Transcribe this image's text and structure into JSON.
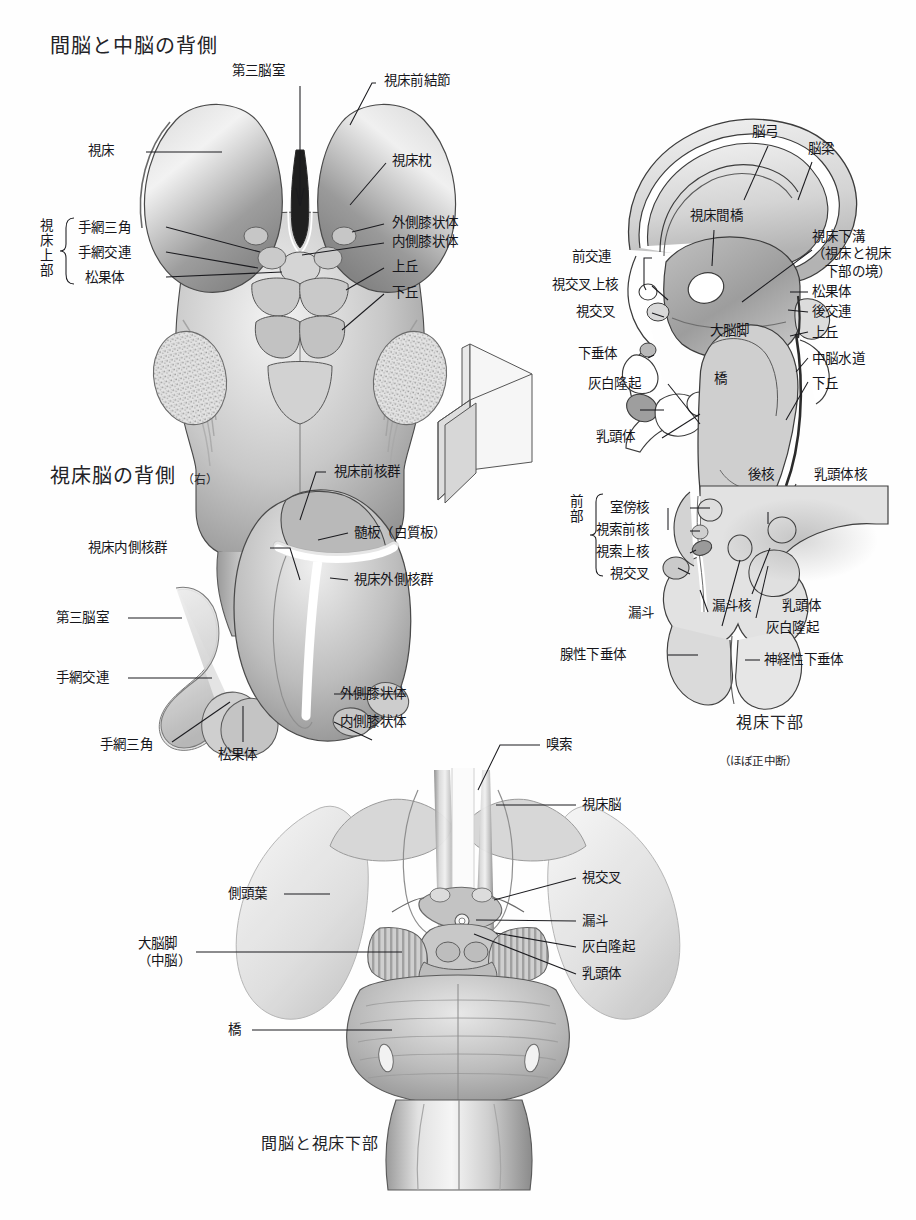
{
  "document": {
    "language": "ja",
    "page_background": "#ffffff",
    "ink_color": "#1b1b1f"
  },
  "panels": [
    {
      "id": "dorsal-diencephalon-midbrain",
      "title": "間脳と中脳の背側",
      "position": "top-left",
      "labels": [
        {
          "name": "third-ventricle",
          "text": "第三脳室"
        },
        {
          "name": "anterior-thalamic-tubercle",
          "text": "視床前結節"
        },
        {
          "name": "thalamus",
          "text": "視床"
        },
        {
          "name": "pulvinar",
          "text": "視床枕"
        },
        {
          "name": "lateral-geniculate-body",
          "text": "外側膝状体"
        },
        {
          "name": "medial-geniculate-body",
          "text": "内側膝状体"
        },
        {
          "name": "superior-colliculus",
          "text": "上丘"
        },
        {
          "name": "inferior-colliculus",
          "text": "下丘"
        },
        {
          "name": "epithalamus-bracket",
          "text": "視床上部"
        },
        {
          "name": "habenular-trigone",
          "text": "手網三角"
        },
        {
          "name": "habenular-commissure",
          "text": "手網交連"
        },
        {
          "name": "pineal-body",
          "text": "松果体"
        }
      ]
    },
    {
      "id": "midsagittal-diencephalon",
      "title": "",
      "position": "top-right",
      "labels": [
        {
          "name": "fornix",
          "text": "脳弓"
        },
        {
          "name": "corpus-callosum",
          "text": "脳梁"
        },
        {
          "name": "interthalamic-adhesion",
          "text": "視床間橋"
        },
        {
          "name": "hypothalamic-sulcus",
          "text": "視床下溝\n（視床と視床\n　下部の境）"
        },
        {
          "name": "anterior-commissure",
          "text": "前交連"
        },
        {
          "name": "suprachiasmatic-nucleus",
          "text": "視交叉上核"
        },
        {
          "name": "optic-chiasm",
          "text": "視交叉"
        },
        {
          "name": "hypophysis",
          "text": "下垂体"
        },
        {
          "name": "tuber-cinereum",
          "text": "灰白隆起"
        },
        {
          "name": "mammillary-body",
          "text": "乳頭体"
        },
        {
          "name": "cerebral-peduncle",
          "text": "大脳脚"
        },
        {
          "name": "pons",
          "text": "橋"
        },
        {
          "name": "pineal-body",
          "text": "松果体"
        },
        {
          "name": "posterior-commissure",
          "text": "後交連"
        },
        {
          "name": "superior-colliculus",
          "text": "上丘"
        },
        {
          "name": "cerebral-aqueduct",
          "text": "中脳水道"
        },
        {
          "name": "inferior-colliculus",
          "text": "下丘"
        }
      ]
    },
    {
      "id": "dorsal-thalamus-right",
      "title": "視床脳の背側",
      "title_suffix": "（右）",
      "position": "middle-left",
      "labels": [
        {
          "name": "anterior-thalamic-nuclei",
          "text": "視床前核群"
        },
        {
          "name": "medullary-lamina",
          "text": "髄板（白質板）"
        },
        {
          "name": "medial-thalamic-nuclei",
          "text": "視床内側核群"
        },
        {
          "name": "lateral-thalamic-nuclei",
          "text": "視床外側核群"
        },
        {
          "name": "third-ventricle",
          "text": "第三脳室"
        },
        {
          "name": "habenular-commissure",
          "text": "手網交連"
        },
        {
          "name": "habenular-trigone",
          "text": "手網三角"
        },
        {
          "name": "pineal-body",
          "text": "松果体"
        },
        {
          "name": "lateral-geniculate-body",
          "text": "外側膝状体"
        },
        {
          "name": "medial-geniculate-body",
          "text": "内側膝状体"
        }
      ]
    },
    {
      "id": "hypothalamus-midsagittal",
      "caption": "視床下部",
      "caption_sub": "（ほぼ正中断）",
      "position": "middle-right",
      "labels": [
        {
          "name": "anterior-region-bracket",
          "text": "前部"
        },
        {
          "name": "paraventricular-nucleus",
          "text": "室傍核"
        },
        {
          "name": "preoptic-nucleus",
          "text": "視索前核"
        },
        {
          "name": "supraoptic-nucleus",
          "text": "視索上核"
        },
        {
          "name": "optic-chiasm",
          "text": "視交叉"
        },
        {
          "name": "posterior-nucleus",
          "text": "後核"
        },
        {
          "name": "mammillary-nucleus",
          "text": "乳頭体核"
        },
        {
          "name": "infundibulum",
          "text": "漏斗"
        },
        {
          "name": "infundibular-nucleus",
          "text": "漏斗核"
        },
        {
          "name": "mammillary-body",
          "text": "乳頭体"
        },
        {
          "name": "tuber-cinereum",
          "text": "灰白隆起"
        },
        {
          "name": "adenohypophysis",
          "text": "腺性下垂体"
        },
        {
          "name": "neurohypophysis",
          "text": "神経性下垂体"
        }
      ]
    },
    {
      "id": "ventral-diencephalon",
      "caption": "間脳と視床下部",
      "position": "bottom",
      "labels": [
        {
          "name": "olfactory-tract",
          "text": "嗅索"
        },
        {
          "name": "thalamencephalon",
          "text": "視床脳"
        },
        {
          "name": "temporal-lobe",
          "text": "側頭葉"
        },
        {
          "name": "optic-chiasm",
          "text": "視交叉"
        },
        {
          "name": "infundibulum",
          "text": "漏斗"
        },
        {
          "name": "tuber-cinereum",
          "text": "灰白隆起"
        },
        {
          "name": "mammillary-body",
          "text": "乳頭体"
        },
        {
          "name": "cerebral-peduncle",
          "text": "大脳脚\n（中脳）"
        },
        {
          "name": "pons",
          "text": "橋"
        }
      ]
    },
    {
      "id": "section-plane-indicator",
      "position": "center",
      "labels": []
    }
  ]
}
